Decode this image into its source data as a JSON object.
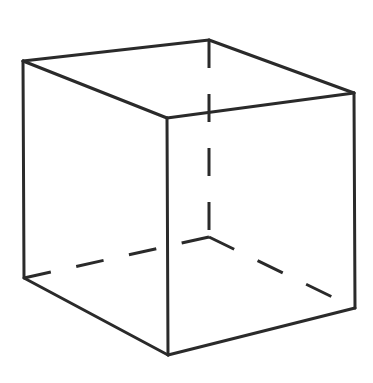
{
  "diagram": {
    "type": "wireframe-cube",
    "projection": "oblique",
    "background": "#ffffff",
    "stroke_color": "#2a2a2a",
    "stroke_width": 3,
    "vertices": {
      "top_left": [
        23,
        61
      ],
      "top_back": [
        209,
        40
      ],
      "top_right": [
        354,
        93
      ],
      "top_front": [
        167,
        118
      ],
      "bottom_left": [
        24,
        278
      ],
      "bottom_back_hidden": [
        209,
        237
      ],
      "bottom_right": [
        355,
        308
      ],
      "bottom_front": [
        168,
        355
      ]
    },
    "visible_edges": [
      [
        "top_left",
        "top_back"
      ],
      [
        "top_back",
        "top_right"
      ],
      [
        "top_right",
        "top_front"
      ],
      [
        "top_front",
        "top_left"
      ],
      [
        "top_left",
        "bottom_left"
      ],
      [
        "top_front",
        "bottom_front"
      ],
      [
        "top_right",
        "bottom_right"
      ],
      [
        "bottom_left",
        "bottom_front"
      ],
      [
        "bottom_front",
        "bottom_right"
      ]
    ],
    "hidden_edges": [
      [
        "top_back",
        "bottom_back_hidden"
      ],
      [
        "bottom_back_hidden",
        "bottom_left"
      ],
      [
        "bottom_back_hidden",
        "bottom_right"
      ]
    ],
    "hidden_edge_style": "dashed"
  }
}
